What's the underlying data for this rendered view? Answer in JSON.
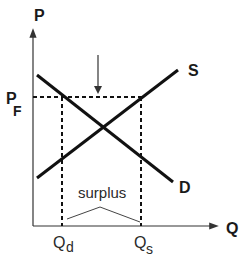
{
  "diagram": {
    "axes": {
      "y_label": "P",
      "x_label": "Q"
    },
    "price_floor": {
      "label_main": "P",
      "label_sub": "F"
    },
    "curves": {
      "supply_label": "S",
      "demand_label": "D"
    },
    "quantities": {
      "qd_main": "Q",
      "qd_sub": "d",
      "qs_main": "Q",
      "qs_sub": "s"
    },
    "annotation": {
      "surplus_label": "surplus"
    },
    "colors": {
      "line": "#111111",
      "axis": "#333333",
      "bracket": "#444444"
    }
  }
}
